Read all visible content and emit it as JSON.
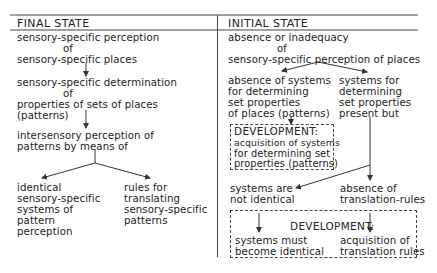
{
  "final_state": {
    "header": "FINAL STATE",
    "perception_line1": "sensory-specific perception",
    "perception_of": "of",
    "perception_line2": "sensory-specific places",
    "determination_line1": "sensory-specific determination",
    "determination_of": "of",
    "determination_line2": "properties of sets of places",
    "determination_line3": "(patterns)",
    "intersensory_line1": "intersensory perception of",
    "intersensory_line2": "patterns by means of",
    "branch_left": [
      "identical",
      "sensory-specific",
      "systems of",
      "pattern",
      "perception"
    ],
    "branch_right": [
      "rules for",
      "translating",
      "sensory-specific",
      "patterns"
    ]
  },
  "initial_state": {
    "header": "INITIAL STATE",
    "absence_line1": "absence or inadequacy",
    "absence_of": "of",
    "absence_line2": "sensory-specific perception of places",
    "left_branch": [
      "absence of systems",
      "for determining",
      "set properties",
      "of places (patterns)"
    ],
    "right_branch": [
      "systems for",
      "determining",
      "set properties",
      "present but"
    ],
    "dev1_title": "DEVELOPMENT:",
    "dev1_lines": [
      "acquisition of systems",
      "for determining set",
      "properties (patterns)"
    ],
    "not_identical": [
      "systems are",
      "not identical"
    ],
    "absence_rules": [
      "absence of",
      "translation-rules"
    ],
    "dev2_title": "DEVELOPMENT:",
    "dev2_left": [
      "systems must",
      "become identical"
    ],
    "dev2_right": [
      "acquisition of",
      "translation rules"
    ]
  }
}
